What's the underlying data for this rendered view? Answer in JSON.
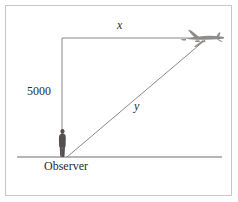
{
  "figure": {
    "name": "airplane-observer-right-triangle",
    "background_color": "#ffffff",
    "border_color": "#c8c8c8",
    "line_color": "#8a8a8a",
    "ink_color": "#2b2b2b",
    "labels": {
      "horizontal_distance": "x",
      "hypotenuse": "y",
      "altitude": "5000",
      "observer": "Observer"
    },
    "icons": {
      "airplane": "airplane-icon",
      "observer_person": "person-icon"
    },
    "geometry": {
      "observer_x": 66,
      "ground_y": 157,
      "apex_x": 62,
      "apex_y": 38,
      "plane_x": 205,
      "plane_y": 38,
      "ground_left_x": 17,
      "ground_right_x": 222
    }
  }
}
